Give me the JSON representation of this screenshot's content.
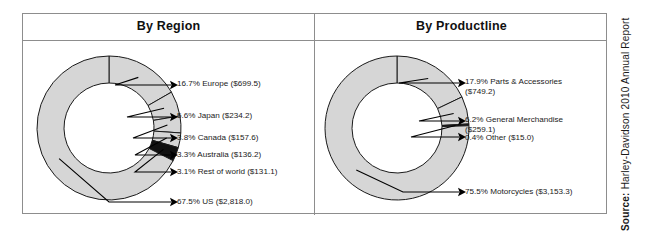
{
  "source": {
    "prefix": "Source:",
    "text": "Harley-Davidson 2010 Annual Report"
  },
  "panels": [
    {
      "id": "region",
      "title": "By Region"
    },
    {
      "id": "productline",
      "title": "By Productline"
    }
  ],
  "colors": {
    "slice_light": "#d6d6d6",
    "slice_dark": "#111111",
    "stroke": "#1a1a1a",
    "frame": "#8d8d8d",
    "text": "#1a1a1a",
    "background": "#ffffff"
  },
  "chart_data": [
    {
      "type": "pie",
      "title": "By Region",
      "donut": true,
      "start_angle": 0,
      "categories": [
        "Europe",
        "Japan",
        "Canada",
        "Australia",
        "Rest of world",
        "US"
      ],
      "values": [
        16.7,
        5.6,
        3.8,
        3.3,
        3.1,
        67.5
      ],
      "amounts": [
        "$699.5",
        "$234.2",
        "$157.6",
        "$136.2",
        "$131.1",
        "$2,818.0"
      ],
      "labels": [
        "16.7% Europe ($699.5)",
        "5.6% Japan ($234.2)",
        "3.8% Canada ($157.6)",
        "3.3% Australia ($136.2)",
        "3.1% Rest of world ($131.1)",
        "67.5% US ($2,818.0)"
      ],
      "fills": [
        "#d6d6d6",
        "#d6d6d6",
        "#d6d6d6",
        "#d6d6d6",
        "#111111",
        "#d6d6d6"
      ],
      "label_pos": [
        {
          "x": 154,
          "y": 38,
          "lx": 92,
          "ly": 44,
          "ax": 148,
          "ay": 44
        },
        {
          "x": 154,
          "y": 70,
          "lx": 104,
          "ly": 76,
          "ax": 148,
          "ay": 76
        },
        {
          "x": 154,
          "y": 92,
          "lx": 110,
          "ly": 97,
          "ax": 148,
          "ay": 97
        },
        {
          "x": 154,
          "y": 109,
          "lx": 112,
          "ly": 114,
          "ax": 148,
          "ay": 114
        },
        {
          "x": 154,
          "y": 126,
          "lx": 112,
          "ly": 131,
          "ax": 148,
          "ay": 131
        },
        {
          "x": 154,
          "y": 156,
          "lx": 86,
          "ly": 161,
          "ax": 148,
          "ay": 161
        }
      ],
      "xlabel": "",
      "ylabel": "",
      "legend": "labels-with-leader-lines"
    },
    {
      "type": "pie",
      "title": "By Productline",
      "donut": true,
      "start_angle": 0,
      "categories": [
        "Parts & Accessories",
        "General Merchandise",
        "Other",
        "Motorcycles"
      ],
      "values": [
        17.9,
        6.2,
        0.4,
        75.5
      ],
      "amounts": [
        "$749.2",
        "$259.1",
        "$15.0",
        "$3,153.3"
      ],
      "labels": [
        "17.9% Parts & Accessories\n($749.2)",
        "6.2% General Merchandise\n($259.1)",
        "0.4% Other ($15.0)",
        "75.5% Motorcycles ($3,153.3)"
      ],
      "fills": [
        "#d6d6d6",
        "#d6d6d6",
        "#111111",
        "#d6d6d6"
      ],
      "label_pos": [
        {
          "x": 150,
          "y": 36,
          "lx": 84,
          "ly": 42,
          "ax": 144,
          "ay": 42
        },
        {
          "x": 150,
          "y": 74,
          "lx": 104,
          "ly": 80,
          "ax": 144,
          "ay": 80
        },
        {
          "x": 150,
          "y": 92,
          "lx": 96,
          "ly": 96,
          "ax": 144,
          "ay": 96
        },
        {
          "x": 150,
          "y": 146,
          "lx": 88,
          "ly": 151,
          "ax": 144,
          "ay": 151
        }
      ],
      "xlabel": "",
      "ylabel": "",
      "legend": "labels-with-leader-lines"
    }
  ]
}
